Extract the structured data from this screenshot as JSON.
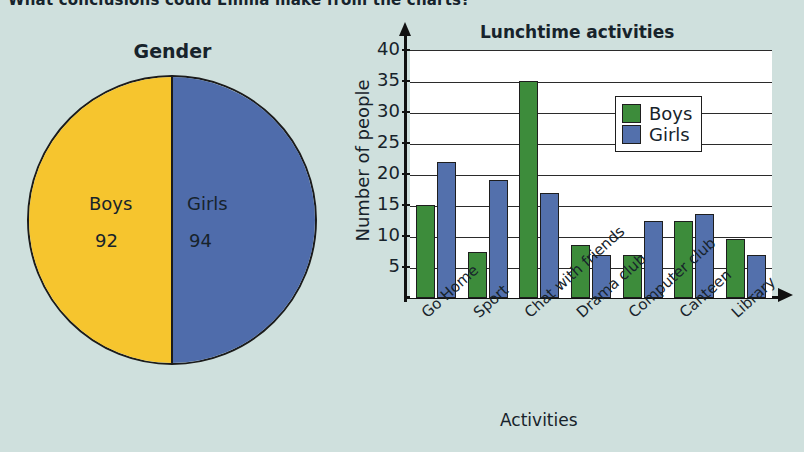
{
  "page": {
    "cut_off_heading": "What conclusions could Emma make from the charts?",
    "background_color": "#cfe0dd"
  },
  "pie": {
    "title": "Gender",
    "slices": [
      {
        "label": "Boys",
        "value": "92",
        "color": "#f6c52e"
      },
      {
        "label": "Girls",
        "value": "94",
        "color": "#4f6cab"
      }
    ]
  },
  "chart_data": {
    "type": "bar",
    "title": "Lunchtime activities",
    "xlabel": "Activities",
    "ylabel": "Number of people",
    "ylim": [
      0,
      40
    ],
    "yticks": [
      "5",
      "10",
      "15",
      "20",
      "25",
      "30",
      "35",
      "40"
    ],
    "grid": true,
    "legend_position": "top-right",
    "categories": [
      "Go Home",
      "Sport",
      "Chat with friends",
      "Drama club",
      "Computer club",
      "Canteen",
      "Library"
    ],
    "series": [
      {
        "name": "Boys",
        "color": "#3d8c3b",
        "values": [
          15,
          7.5,
          35,
          8.5,
          7,
          12.5,
          9.5
        ]
      },
      {
        "name": "Girls",
        "color": "#5370ac",
        "values": [
          22,
          19,
          17,
          7,
          12.5,
          13.5,
          7
        ]
      }
    ]
  }
}
